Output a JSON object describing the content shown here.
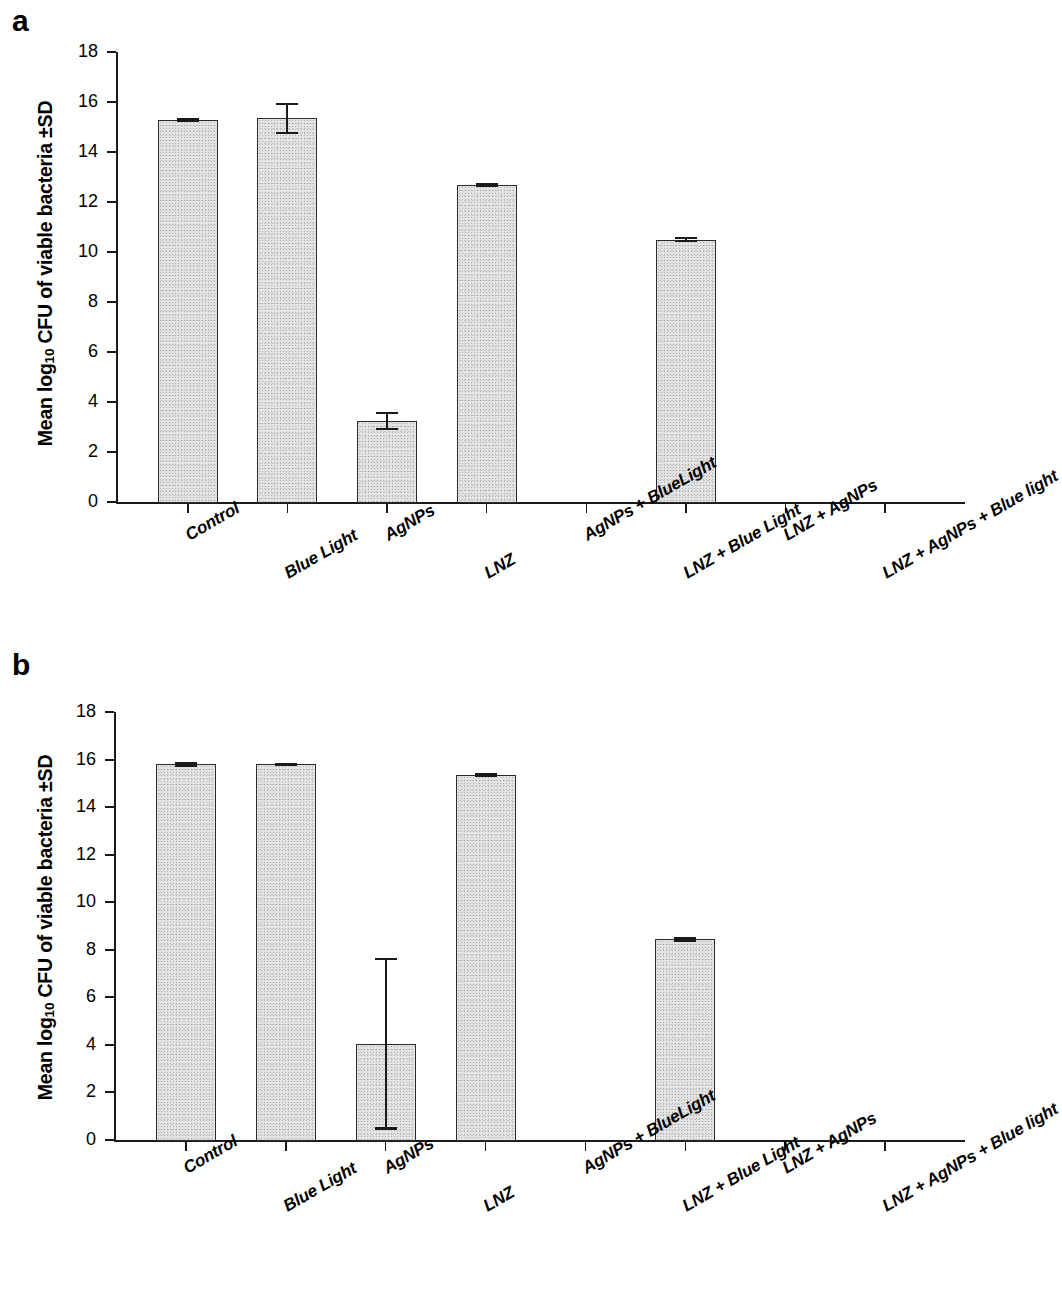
{
  "figure": {
    "panel_a_letter": "a",
    "panel_b_letter": "b",
    "y_axis_title_pre": "Mean log",
    "y_axis_title_sub": "10",
    "y_axis_title_post": " CFU of viable bacteria ±SD"
  },
  "chart_data": [
    {
      "type": "bar",
      "panel": "a",
      "title": "",
      "xlabel": "",
      "ylabel": "Mean log10 CFU of viable bacteria ±SD",
      "ylim": [
        0,
        18
      ],
      "ytick_labels": [
        "0",
        "2",
        "4",
        "6",
        "8",
        "10",
        "12",
        "14",
        "16",
        "18"
      ],
      "ytick_values": [
        0,
        2,
        4,
        6,
        8,
        10,
        12,
        14,
        16,
        18
      ],
      "grid": false,
      "legend": "none",
      "categories": [
        "Control",
        "Blue Light",
        "AgNPs",
        "LNZ",
        "AgNPs + BlueLight",
        "LNZ + Blue Light",
        "LNZ + AgNPs",
        "LNZ + AgNPs + Blue light"
      ],
      "values": [
        15.3,
        15.35,
        3.25,
        12.7,
        0,
        10.5,
        0,
        0
      ],
      "errors": [
        0.08,
        0.62,
        0.35,
        0.07,
        0,
        0.1,
        0,
        0
      ]
    },
    {
      "type": "bar",
      "panel": "b",
      "title": "",
      "xlabel": "",
      "ylabel": "Mean log10 CFU of viable bacteria ±SD",
      "ylim": [
        0,
        18
      ],
      "ytick_labels": [
        "0",
        "2",
        "4",
        "6",
        "8",
        "10",
        "12",
        "14",
        "16",
        "18"
      ],
      "ytick_values": [
        0,
        2,
        4,
        6,
        8,
        10,
        12,
        14,
        16,
        18
      ],
      "grid": false,
      "legend": "none",
      "categories": [
        "Control",
        "Blue Light",
        "AgNPs",
        "LNZ",
        "AgNPs + BlueLight",
        "LNZ + Blue Light",
        "LNZ + AgNPs",
        "LNZ + AgNPs + Blue light"
      ],
      "values": [
        15.8,
        15.8,
        4.05,
        15.35,
        0,
        8.45,
        0,
        0
      ],
      "errors": [
        0.08,
        0.06,
        3.6,
        0.08,
        0,
        0.1,
        0,
        0
      ]
    }
  ],
  "colors": {
    "bar_fill": "#e3e3e3",
    "bar_border": "#2a2a2a",
    "axis": "#1a1a1a",
    "text": "#000000",
    "background": "#ffffff"
  }
}
